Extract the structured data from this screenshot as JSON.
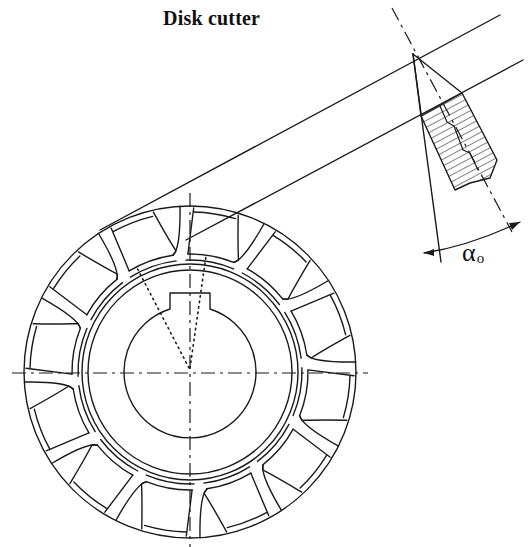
{
  "title": "Disk cutter",
  "annotations": {
    "angle_symbol": "α",
    "angle_subscript": "o"
  },
  "diagram": {
    "type": "mechanical-drawing",
    "cutter": {
      "center": [
        190,
        372
      ],
      "outer_radius": 166,
      "teeth_count": 12,
      "bore_radius": 66,
      "keyway": {
        "width": 40,
        "depth": 13
      }
    },
    "tool_detail": {
      "tip": [
        413,
        54
      ],
      "angle_label": "αo"
    },
    "stroke_color": "#1a1a1a",
    "background": "#ffffff"
  }
}
